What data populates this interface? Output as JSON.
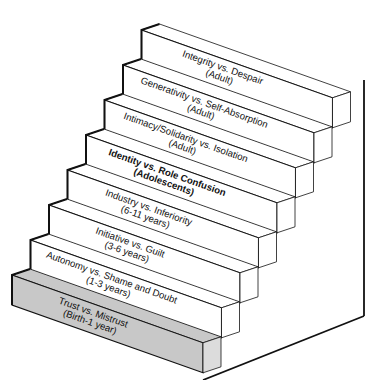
{
  "diagram": {
    "colors": {
      "background": "#ffffff",
      "step_fill": "#ffffff",
      "base_step_fill": "#c8c8c8",
      "outline": "#111111"
    },
    "steps": [
      {
        "stage": "Trust vs. Mistrust",
        "age": "(Birth-1 year)",
        "highlighted": true
      },
      {
        "stage": "Autonomy vs. Shame and Doubt",
        "age": "(1-3 years)",
        "highlighted": false
      },
      {
        "stage": "Initiative vs. Guilt",
        "age": "(3-6 years)",
        "highlighted": false
      },
      {
        "stage": "Industry vs. Inferiority",
        "age": "(6-11 years)",
        "highlighted": false
      },
      {
        "stage": "Identity vs. Role Confusion",
        "age": "(Adolescents)",
        "highlighted": false
      },
      {
        "stage": "Intimacy/Solidarity vs. Isolation",
        "age": "(Adult)",
        "highlighted": false
      },
      {
        "stage": "Generativity vs. Self-Absorption",
        "age": "(Adult)",
        "highlighted": false
      },
      {
        "stage": "Integrity vs. Despair",
        "age": "(Adult)",
        "highlighted": false
      }
    ]
  }
}
